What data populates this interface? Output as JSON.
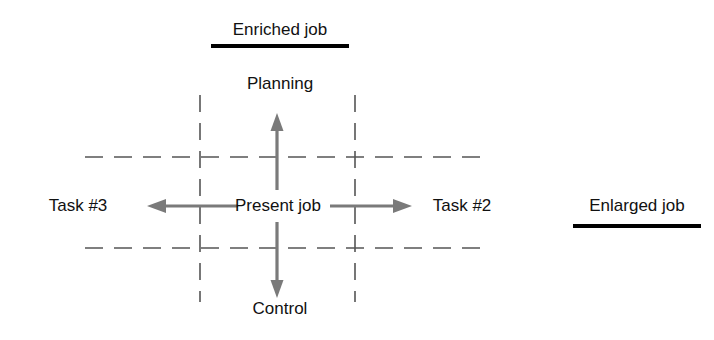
{
  "diagram": {
    "title_top": "Enriched job",
    "title_right": "Enlarged job",
    "center_label": "Present job",
    "up_label": "Planning",
    "down_label": "Control",
    "left_label": "Task #3",
    "right_label": "Task #2",
    "colors": {
      "background": "#ffffff",
      "text": "#111111",
      "arrow": "#7a7a7a",
      "dashed_line": "#555555",
      "underline": "#000000"
    },
    "icons": {
      "up_arrow": "arrow-up-icon",
      "down_arrow": "arrow-down-icon",
      "left_arrow": "arrow-left-icon",
      "right_arrow": "arrow-right-icon"
    }
  }
}
